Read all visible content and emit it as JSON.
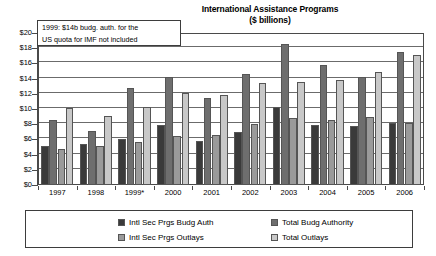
{
  "chart_data": {
    "type": "bar",
    "title": "International Assistance Programs",
    "subtitle": "($ billions)",
    "xlabel": "",
    "ylabel": "",
    "ylim": [
      0,
      20
    ],
    "ytick_step": 2,
    "grid": true,
    "legend_position": "bottom",
    "categories": [
      "1997",
      "1998",
      "1999*",
      "2000",
      "2001",
      "2002",
      "2003",
      "2004",
      "2005",
      "2006"
    ],
    "ytick_labels": [
      "$0",
      "$2",
      "$4",
      "$6",
      "$8",
      "$10",
      "$12",
      "$14",
      "$16",
      "$18",
      "$20"
    ],
    "ytick_values": [
      0,
      2,
      4,
      6,
      8,
      10,
      12,
      14,
      16,
      18,
      20
    ],
    "series": [
      {
        "name": "Intl Sec Prgs Budg Auth",
        "color": "#3a3a3a",
        "values": [
          5.1,
          5.35,
          6.0,
          7.9,
          5.75,
          6.95,
          10.25,
          7.85,
          7.7,
          8.2
        ]
      },
      {
        "name": "Total Budg Authority",
        "color": "#6e6e6e",
        "values": [
          8.5,
          7.15,
          12.7,
          14.15,
          11.4,
          14.6,
          18.6,
          15.8,
          14.25,
          17.45
        ]
      },
      {
        "name": "Intl Sec Prgs Outlays",
        "color": "#9a9a9a",
        "values": [
          4.7,
          5.15,
          5.65,
          6.4,
          6.6,
          8.0,
          8.8,
          8.5,
          8.9,
          8.15
        ]
      },
      {
        "name": "Total Outlays",
        "color": "#c8c8c8",
        "values": [
          10.15,
          9.05,
          10.2,
          12.15,
          11.9,
          13.45,
          13.55,
          13.85,
          14.9,
          17.15
        ]
      }
    ],
    "annotation": {
      "line1": "1999: $14b budg. auth. for the",
      "line2": "US quota for IMF not included"
    }
  }
}
